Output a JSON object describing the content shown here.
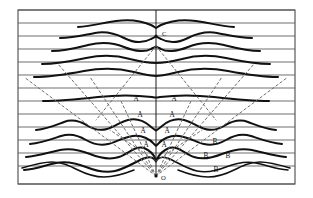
{
  "figure": {
    "background_color": "#ffffff",
    "frame": {
      "x": 18,
      "y": 10,
      "width": 277,
      "height": 174,
      "stroke_color": "#4a4a4a"
    },
    "axis": {
      "name": "central-vertical-axis",
      "x": 156,
      "y_top": 10,
      "y_bottom": 176,
      "color": "#1a1a1a"
    },
    "grid": {
      "name": "horizontal-grid-lines",
      "count": 13,
      "color": "#555555",
      "y_values": [
        10,
        23,
        36,
        49,
        62,
        75,
        88,
        101,
        114,
        127,
        140,
        153,
        166,
        184
      ]
    },
    "point_labels": [
      {
        "id": "point-c",
        "text": "C",
        "x": 162,
        "y": 36,
        "has_dot": true,
        "dot_x": 156,
        "dot_y": 36
      },
      {
        "id": "point-o",
        "text": "O",
        "x": 161,
        "y": 180,
        "has_dot": true,
        "dot_x": 156,
        "dot_y": 176
      }
    ],
    "order_labels": [
      {
        "id": "label-a-1-left",
        "text": "A",
        "x": 136,
        "y": 101
      },
      {
        "id": "label-a-1-right",
        "text": "A",
        "x": 174,
        "y": 101
      },
      {
        "id": "label-a-2-left",
        "text": "A",
        "x": 140,
        "y": 117
      },
      {
        "id": "label-a-2-right",
        "text": "A",
        "x": 172,
        "y": 117
      },
      {
        "id": "label-a-3-left",
        "text": "A",
        "x": 143,
        "y": 133
      },
      {
        "id": "label-a-3-right",
        "text": "A",
        "x": 167,
        "y": 133
      },
      {
        "id": "label-a-4-left",
        "text": "A",
        "x": 146,
        "y": 147
      },
      {
        "id": "label-a-4-right",
        "text": "A",
        "x": 164,
        "y": 147
      },
      {
        "id": "label-b-1",
        "text": "B",
        "x": 215,
        "y": 144
      },
      {
        "id": "label-b-2-left",
        "text": "B",
        "x": 206,
        "y": 158
      },
      {
        "id": "label-b-2-right",
        "text": "B",
        "x": 228,
        "y": 158
      },
      {
        "id": "label-b-3",
        "text": "B",
        "x": 216,
        "y": 172
      }
    ],
    "wavefronts": [
      {
        "id": "wavefront-1",
        "path": "M 78 27 C 92 26 102 23 116 21 C 130 19 142 21 151 25 C 154 26.5 155 27.5 156 28 C 157 27.5 158 26.5 161 25 C 170 21 182 19 196 21 C 210 23 220 26 234 27"
      },
      {
        "id": "wavefront-2",
        "path": "M 60 38 C 74 38 84 35 95 33 C 106 31 114 33 124 38 C 134 43 144 43 151 39 C 154 37.5 155 36.8 156 36.5 C 157 36.8 158 37.5 161 39 C 168 43 178 43 188 38 C 198 33 206 31 217 33 C 228 35 238 38 252 38"
      },
      {
        "id": "wavefront-3",
        "path": "M 52 51 C 66 51 76 48 88 45 C 100 42 112 42 124 47 C 136 52 146 52 151 49 C 154 47.5 155 47 156 46.8 C 157 47 158 47.5 161 49 C 166 52 176 52 188 47 C 200 42 212 42 224 45 C 236 48 246 51 260 51"
      },
      {
        "id": "wavefront-4",
        "path": "M 42 64 C 58 64 72 61 86 58 C 100 55 116 55 130 59 C 142 62 150 63 156 63 C 162 63 170 62 182 59 C 196 55 212 55 226 58 C 240 61 254 64 270 64"
      },
      {
        "id": "wavefront-5",
        "path": "M 34 77 C 52 77 68 74 84 71 C 100 68 118 68 134 72 C 145 74.5 151 76 156 76 C 161 76 167 74.5 178 72 C 194 68 212 68 228 71 C 244 74 260 77 278 77"
      },
      {
        "id": "wavefront-6",
        "path": "M 43 101 C 62 101 80 99 98 97 C 116 95 136 95 152 97 C 154 97.3 155 97.5 156 97.5 C 157 97.5 158 97.3 160 97 C 176 95 196 95 214 97 C 232 99 250 101 269 101"
      },
      {
        "id": "wavefront-7",
        "path": "M 36 130 C 48 129 56 125 64 122 C 72 119 80 121 88 126 C 94 129.5 100 131 107 129 C 114 127 120 122 128 120 C 136 118 144 121 150 126 C 153 128.5 155 130 156 130.5 C 157 130 159 128.5 162 126 C 168 121 176 118 184 120 C 192 122 198 127 205 129 C 212 131 218 129.5 224 126 C 232 121 240 119 248 122 C 256 125 264 129 276 130"
      },
      {
        "id": "wavefront-8",
        "path": "M 30 144 C 42 143 52 139 61 136 C 70 133 78 135 86 140 C 93 144 100 146 108 144 C 116 142 124 137 133 136 C 142 135 150 139 154 144 C 155 145 155.5 145.5 156 145.8 C 156.5 145.5 157 145 158 144 C 162 139 170 135 179 136 C 188 137 196 142 204 144 C 212 146 219 144 226 140 C 234 135 242 133 251 136 C 260 139 270 143 282 144"
      },
      {
        "id": "wavefront-9",
        "path": "M 26 157 C 38 156 50 152 60 150 C 70 148 80 150 90 154 C 100 158 110 160 119 157 C 128 154 136 145 144 148 C 150 150.5 154 155 155.5 159 C 156 160 156 160.5 156 161 C 156 160.5 156.5 159.8 157 159 C 159 155 163 150.5 169 148 C 177 145 185 154 194 157 C 203 160 212 158 222 154 C 232 150 242 148 252 150 C 262 152 274 156 286 157"
      },
      {
        "id": "wavefront-10",
        "path": "M 24 170 C 36 169 46 165 56 163 C 66 161 76 163 86 167 C 96 171 106 173 115 171 C 124 169 132 164 140 160 C 146 157 151 156 154 159 C 155 160 155.5 161 156 161.5"
      },
      {
        "id": "wavefront-10b",
        "path": "M 156 161.5 C 156.5 161 157 160 158 159 C 161 156 166 157 172 160 C 180 164 188 169 197 171 C 206 173 216 171 226 167 C 236 163 246 161 256 163 C 266 165 276 169 288 170"
      },
      {
        "id": "wavefront-11",
        "path": "M 22 168 C 32 165 42 162 52 162 C 62 162 70 166 78 170 C 86 174 94 177 104 177 C 114 177 124 174 134 170"
      },
      {
        "id": "wavefront-11b",
        "path": "M 178 170 C 188 174 198 177 208 177 C 218 177 226 174 234 170 C 242 166 250 162 260 162 C 270 162 280 165 290 168"
      }
    ],
    "rays": [
      {
        "id": "ray-left-outer",
        "path": "M 156 176 L 24 77"
      },
      {
        "id": "ray-left-mid",
        "path": "M 156 176 L 58 64"
      },
      {
        "id": "ray-left-inner",
        "path": "M 156 176 L 90 77"
      },
      {
        "id": "ray-left-inner2",
        "path": "M 156 176 L 121 101"
      },
      {
        "id": "ray-right-inner2",
        "path": "M 156 176 L 191 101"
      },
      {
        "id": "ray-right-inner",
        "path": "M 156 176 L 222 77"
      },
      {
        "id": "ray-right-mid",
        "path": "M 156 176 L 254 64"
      },
      {
        "id": "ray-right-outer",
        "path": "M 156 176 L 288 77"
      },
      {
        "id": "ray-c-left",
        "path": "M 156 46 L 96 120"
      },
      {
        "id": "ray-c-right",
        "path": "M 156 46 L 216 120"
      },
      {
        "id": "ray-low-left",
        "path": "M 156 161 L 110 130"
      },
      {
        "id": "ray-low-right",
        "path": "M 156 161 L 202 130"
      }
    ]
  }
}
